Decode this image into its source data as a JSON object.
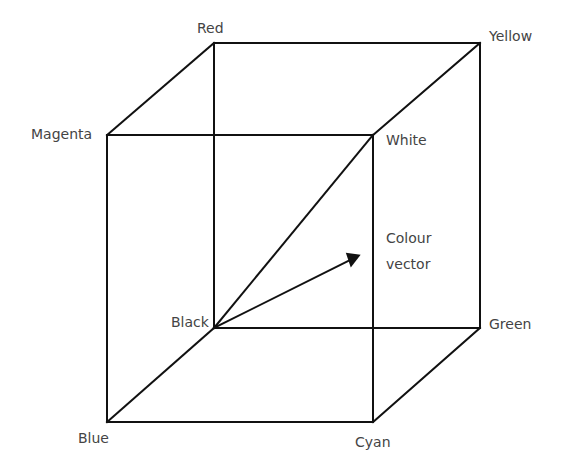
{
  "diagram": {
    "vertices": {
      "red": {
        "label": "Red",
        "x": 214,
        "y": 43
      },
      "yellow": {
        "label": "Yellow",
        "x": 480,
        "y": 43
      },
      "magenta": {
        "label": "Magenta",
        "x": 107,
        "y": 135
      },
      "white": {
        "label": "White",
        "x": 373,
        "y": 135
      },
      "black": {
        "label": "Black",
        "x": 214,
        "y": 328
      },
      "green": {
        "label": "Green",
        "x": 480,
        "y": 328
      },
      "blue": {
        "label": "Blue",
        "x": 107,
        "y": 422
      },
      "cyan": {
        "label": "Cyan",
        "x": 373,
        "y": 422
      }
    },
    "vector_label_line1": "Colour",
    "vector_label_line2": "vector",
    "line_color": "#111111",
    "text_color": "#444444"
  }
}
